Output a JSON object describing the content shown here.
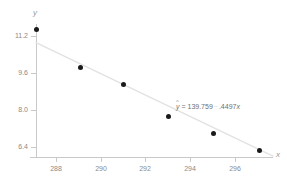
{
  "chart_data": {
    "type": "scatter",
    "title": "",
    "xlabel": "x",
    "ylabel": "y",
    "x": [
      287.1,
      289.15,
      291.1,
      293.15,
      295.2,
      297.3
    ],
    "y": [
      11.2,
      9.6,
      8.85,
      7.5,
      6.75,
      6.05
    ],
    "points": [
      {
        "x": 287.1,
        "y": 11.2
      },
      {
        "x": 289.15,
        "y": 9.6
      },
      {
        "x": 291.1,
        "y": 8.85
      },
      {
        "x": 293.15,
        "y": 7.5
      },
      {
        "x": 295.2,
        "y": 6.75
      },
      {
        "x": 297.3,
        "y": 6.05
      }
    ],
    "xlim": [
      287.1,
      297.9
    ],
    "ylim": [
      5.75,
      11.45
    ],
    "xticks": [
      288,
      290,
      292,
      294,
      296
    ],
    "xtick_labels": [
      "288",
      "290",
      "292",
      "294",
      "296"
    ],
    "yticks": [
      6.4,
      8.0,
      9.6,
      11.2
    ],
    "ytick_labels": [
      "6.4",
      "8.0",
      "9.6",
      "11.2"
    ],
    "grid": false,
    "legend": false,
    "series": [
      {
        "name": "observations",
        "marker": "filled-circle",
        "color": "#1a1a1a",
        "values": [
          11.2,
          9.6,
          8.85,
          7.5,
          6.75,
          6.05
        ]
      },
      {
        "name": "regression-line",
        "type": "line",
        "color": "#e2e2e2",
        "intercept": 139.759,
        "slope": -0.4497,
        "endpoints": [
          {
            "x": 287.1,
            "y": 10.65
          },
          {
            "x": 297.9,
            "y": 5.79
          }
        ]
      }
    ],
    "annotations": [
      {
        "name": "regression-equation",
        "yhat_symbol": "y",
        "hat_glyph": "^",
        "equals": "=",
        "intercept_text": "139.759",
        "sign_text": "−",
        "slope_text": ".4497",
        "x_symbol": "x",
        "full_text": "ŷ = 139.759 − .4497x"
      }
    ],
    "colors": {
      "marker": "#1a1a1a",
      "line": "#e2e2e2",
      "axis": "#c9c9c9",
      "tick_label": "#8a8a8a",
      "annotation": "#6f6f6f",
      "background": "#ffffff"
    }
  }
}
